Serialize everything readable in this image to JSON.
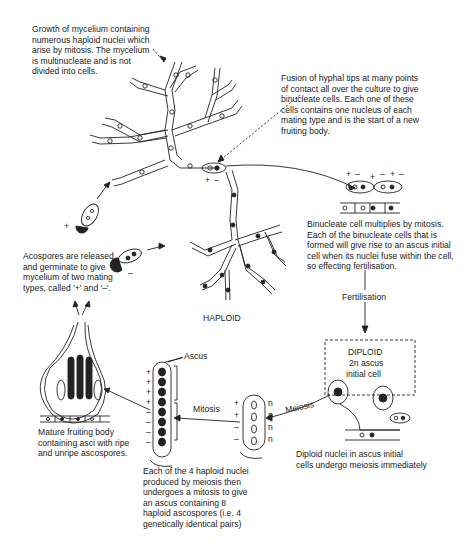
{
  "diagram": {
    "annotations": {
      "mycelium_growth": "Growth of mycelium containing\nnumerous haploid nuclei which\narise by mitosis.  The mycelium\nis multinucleate and is not\ndivided into cells.",
      "hyphal_fusion": "Fusion of hyphal tips at many points\nof contact all over the culture to give\nbinucleate cells.  Each one of these\ncells contains one nucleus of each\nmating type and is the start of a new\nfruiting body.",
      "binucleate_mitosis": "Binucleate cell multiplies by mitosis.\nEach of the binucleate cells that is\nformed will give rise to an ascus initial\ncell when its nuclei fuse within the cell,\nso effecting fertilisation.",
      "ascospores_released": "Acospores are released\nand germinate to give\nmycelium of two mating\ntypes, called '+' and '–'.",
      "mature_fruiting_body": "Mature fruiting body\ncontaining asci with ripe\nand unripe ascospores.",
      "mitosis_ascus": "Each of the 4 haploid nuclei\nproduced by meiosis then\nundergoes a mitosis to give\nan ascus containing 8\nhaploid ascospores (i.e. 4\ngenetically identical pairs)",
      "diploid_meiosis": "Diploid nuclei in ascus initial\ncells undergo meiosis immediately"
    },
    "labels": {
      "haploid": "HAPLOID",
      "diploid": "DIPLOID",
      "diploid_cell_line1": "2n ascus",
      "diploid_cell_line2": "initial cell",
      "fertilisation": "Fertilisation",
      "meiosis": "Meiosis",
      "mitosis": "Mitosis",
      "ascus": "Ascus",
      "plus": "+",
      "minus": "–",
      "n": "n"
    },
    "colors": {
      "ink": "#1a1a1a",
      "background": "#ffffff"
    }
  }
}
